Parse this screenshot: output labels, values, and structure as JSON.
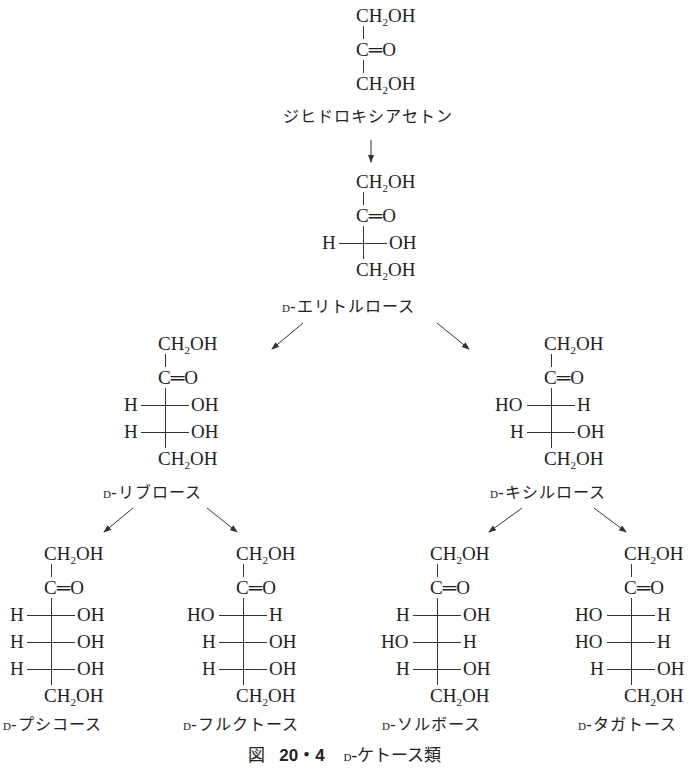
{
  "figure": {
    "caption_prefix": "図",
    "caption_number": "20・4",
    "caption_d": "D",
    "caption_text": "‐ケトース類"
  },
  "molecules": [
    {
      "id": "dihydroxyacetone",
      "name_d": "",
      "name": "ジヒドロキシアセトン",
      "top": "CH2OH",
      "carbonyl": "C=O",
      "rows": [],
      "bottom": "CH2OH"
    },
    {
      "id": "d-erythrulose",
      "name_d": "D",
      "name": "‐エリトルロース",
      "top": "CH2OH",
      "carbonyl": "C=O",
      "rows": [
        {
          "left": "H",
          "right": "OH"
        }
      ],
      "bottom": "CH2OH"
    },
    {
      "id": "d-ribulose",
      "name_d": "D",
      "name": "‐リブロース",
      "top": "CH2OH",
      "carbonyl": "C=O",
      "rows": [
        {
          "left": "H",
          "right": "OH"
        },
        {
          "left": "H",
          "right": "OH"
        }
      ],
      "bottom": "CH2OH"
    },
    {
      "id": "d-xylulose",
      "name_d": "D",
      "name": "‐キシルロース",
      "top": "CH2OH",
      "carbonyl": "C=O",
      "rows": [
        {
          "left": "HO",
          "right": "H"
        },
        {
          "left": "H",
          "right": "OH"
        }
      ],
      "bottom": "CH2OH"
    },
    {
      "id": "d-psicose",
      "name_d": "D",
      "name": "‐プシコース",
      "top": "CH2OH",
      "carbonyl": "C=O",
      "rows": [
        {
          "left": "H",
          "right": "OH"
        },
        {
          "left": "H",
          "right": "OH"
        },
        {
          "left": "H",
          "right": "OH"
        }
      ],
      "bottom": "CH2OH"
    },
    {
      "id": "d-fructose",
      "name_d": "D",
      "name": "‐フルクトース",
      "top": "CH2OH",
      "carbonyl": "C=O",
      "rows": [
        {
          "left": "HO",
          "right": "H"
        },
        {
          "left": "H",
          "right": "OH"
        },
        {
          "left": "H",
          "right": "OH"
        }
      ],
      "bottom": "CH2OH"
    },
    {
      "id": "d-sorbose",
      "name_d": "D",
      "name": "‐ソルボース",
      "top": "CH2OH",
      "carbonyl": "C=O",
      "rows": [
        {
          "left": "H",
          "right": "OH"
        },
        {
          "left": "HO",
          "right": "H"
        },
        {
          "left": "H",
          "right": "OH"
        }
      ],
      "bottom": "CH2OH"
    },
    {
      "id": "d-tagatose",
      "name_d": "D",
      "name": "‐タガトース",
      "top": "CH2OH",
      "carbonyl": "C=O",
      "rows": [
        {
          "left": "HO",
          "right": "H"
        },
        {
          "left": "HO",
          "right": "H"
        },
        {
          "left": "H",
          "right": "OH"
        }
      ],
      "bottom": "CH2OH"
    }
  ],
  "arrows": [
    {
      "from": "dihydroxyacetone",
      "to": "d-erythrulose"
    },
    {
      "from": "d-erythrulose",
      "to": "d-ribulose"
    },
    {
      "from": "d-erythrulose",
      "to": "d-xylulose"
    },
    {
      "from": "d-ribulose",
      "to": "d-psicose"
    },
    {
      "from": "d-ribulose",
      "to": "d-fructose"
    },
    {
      "from": "d-xylulose",
      "to": "d-sorbose"
    },
    {
      "from": "d-xylulose",
      "to": "d-tagatose"
    }
  ]
}
